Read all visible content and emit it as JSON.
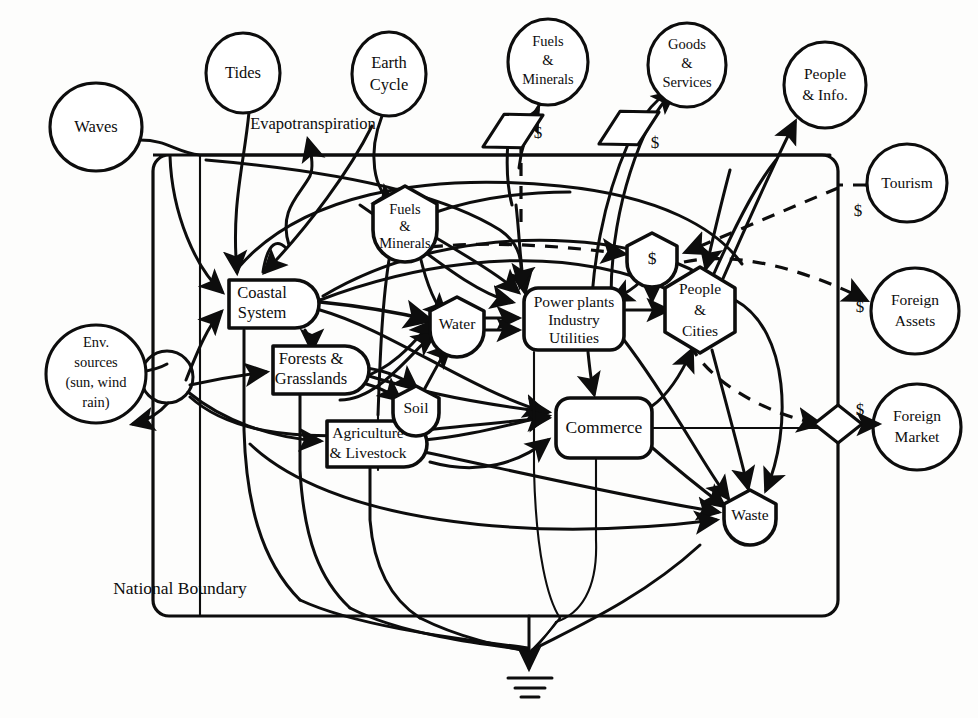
{
  "figure": {
    "kind": "energy-systems-language-diagram",
    "boundary_label": "National Boundary",
    "inline_annotation": "Evapotranspiration",
    "background_color": "#fdfdfc",
    "line_color": "#0d0d0d"
  },
  "external_sources": [
    {
      "id": "waves",
      "label_lines": [
        "Waves"
      ],
      "symbol": "circle-source",
      "cx": 96,
      "cy": 127,
      "rx": 46,
      "ry": 44
    },
    {
      "id": "tides",
      "label_lines": [
        "Tides"
      ],
      "symbol": "circle-source",
      "cx": 243,
      "cy": 73,
      "rx": 37,
      "ry": 40
    },
    {
      "id": "earth-cycle",
      "label_lines": [
        "Earth",
        "Cycle"
      ],
      "symbol": "circle-source",
      "cx": 389,
      "cy": 74,
      "rx": 37,
      "ry": 42
    },
    {
      "id": "fuels-minerals-ext",
      "label_lines": [
        "Fuels",
        "&",
        "Minerals"
      ],
      "symbol": "circle-source",
      "cx": 548,
      "cy": 62,
      "rx": 40,
      "ry": 43
    },
    {
      "id": "goods-services",
      "label_lines": [
        "Goods",
        "&",
        "Services"
      ],
      "symbol": "circle-source",
      "cx": 687,
      "cy": 65,
      "rx": 39,
      "ry": 42
    },
    {
      "id": "people-info",
      "label_lines": [
        "People",
        "& Info."
      ],
      "symbol": "circle-source",
      "cx": 825,
      "cy": 85,
      "rx": 41,
      "ry": 43
    },
    {
      "id": "tourism",
      "label_lines": [
        "Tourism"
      ],
      "symbol": "circle-source",
      "cx": 907,
      "cy": 183,
      "rx": 40,
      "ry": 39
    },
    {
      "id": "foreign-assets",
      "label_lines": [
        "Foreign",
        "Assets"
      ],
      "symbol": "circle-source",
      "cx": 915,
      "cy": 311,
      "rx": 44,
      "ry": 43
    },
    {
      "id": "foreign-market",
      "label_lines": [
        "Foreign",
        "Market"
      ],
      "symbol": "circle-source",
      "cx": 917,
      "cy": 427,
      "rx": 44,
      "ry": 43
    },
    {
      "id": "env-sources",
      "label_lines": [
        "Env.",
        "sources",
        "(sun, wind",
        "rain)"
      ],
      "symbol": "circle-source",
      "cx": 96,
      "cy": 374,
      "rx": 50,
      "ry": 49
    }
  ],
  "internal_components": [
    {
      "id": "coastal-system",
      "label_lines": [
        "Coastal",
        "System"
      ],
      "symbol": "producer-bullet",
      "x": 229,
      "y": 280,
      "w": 90,
      "h": 48
    },
    {
      "id": "forests-grasslands",
      "label_lines": [
        "Forests &",
        "Grasslands"
      ],
      "symbol": "producer-bullet",
      "x": 273,
      "y": 346,
      "w": 96,
      "h": 48
    },
    {
      "id": "agriculture-livestock",
      "label_lines": [
        "Agriculture",
        "& Livestock"
      ],
      "symbol": "producer-bullet",
      "x": 327,
      "y": 421,
      "w": 100,
      "h": 46
    },
    {
      "id": "power-plants",
      "label_lines": [
        "Power plants",
        "Industry",
        "Utilities"
      ],
      "symbol": "rounded-box",
      "x": 524,
      "y": 288,
      "w": 100,
      "h": 62
    },
    {
      "id": "commerce",
      "label_lines": [
        "Commerce"
      ],
      "symbol": "rounded-box",
      "x": 556,
      "y": 398,
      "w": 96,
      "h": 60
    },
    {
      "id": "fuels-minerals-int",
      "label_lines": [
        "Fuels",
        "&",
        "Minerals"
      ],
      "symbol": "storage-tank",
      "cx": 405,
      "cy": 222,
      "r": 36
    },
    {
      "id": "water",
      "label_lines": [
        "Water"
      ],
      "symbol": "storage-tank",
      "cx": 457,
      "cy": 325,
      "r": 29
    },
    {
      "id": "soil",
      "label_lines": [
        "Soil"
      ],
      "symbol": "storage-tank",
      "cx": 416,
      "cy": 409,
      "r": 25
    },
    {
      "id": "money-storage",
      "label_lines": [
        "$"
      ],
      "symbol": "storage-tank",
      "cx": 652,
      "cy": 259,
      "r": 27
    },
    {
      "id": "waste",
      "label_lines": [
        "Waste"
      ],
      "symbol": "storage-tank",
      "cx": 750,
      "cy": 516,
      "r": 28
    },
    {
      "id": "people-cities",
      "label_lines": [
        "People",
        "&",
        "Cities"
      ],
      "symbol": "hexagon",
      "cx": 700,
      "cy": 310,
      "rx": 38,
      "ry": 43
    }
  ],
  "transaction_symbols": [
    {
      "id": "tx-fuels-import",
      "label": "$",
      "cx": 513,
      "cy": 131,
      "label_x": 538,
      "label_y": 134,
      "rot": -28,
      "w": 34,
      "h": 19
    },
    {
      "id": "tx-goods-export",
      "label": "$",
      "cx": 629,
      "cy": 128,
      "label_x": 655,
      "label_y": 142,
      "rot": -28,
      "w": 34,
      "h": 19
    },
    {
      "id": "tx-foreign-market",
      "label": "$",
      "cx": 838,
      "cy": 424,
      "label_x": 860,
      "label_y": 409,
      "rot": 0,
      "w": 34,
      "h": 19
    }
  ],
  "money_labels": [
    {
      "id": "money-tourism",
      "text": "$",
      "x": 858,
      "y": 210
    },
    {
      "id": "money-foreign-assets",
      "text": "$",
      "x": 860,
      "y": 306
    }
  ],
  "ground_symbol": {
    "id": "heat-sink-ground",
    "x": 529,
    "y": 655
  }
}
